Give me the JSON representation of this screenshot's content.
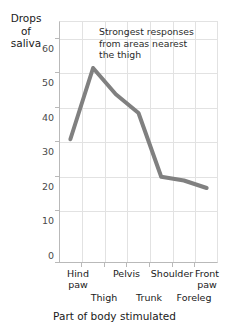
{
  "chart_data": {
    "type": "line",
    "title": "",
    "xlabel": "Part of body stimulated",
    "ylabel": "Drops of saliva",
    "ylabel_lines": [
      "Drops",
      "of",
      "saliva"
    ],
    "categories": [
      "Hind paw",
      "Thigh",
      "Pelvis",
      "Trunk",
      "Shoulder",
      "Foreleg",
      "Front paw"
    ],
    "values": [
      33,
      52,
      45,
      40,
      23,
      22,
      20
    ],
    "ylim": [
      0,
      65
    ],
    "yticks": [
      0,
      10,
      20,
      30,
      40,
      50,
      60
    ],
    "ytick_labels": [
      "0",
      "10",
      "20",
      "30",
      "40",
      "50",
      "60"
    ],
    "grid": true,
    "legend": "none",
    "series": [
      {
        "name": "Drops of saliva",
        "color": "#808080",
        "values": [
          33,
          52,
          45,
          40,
          23,
          22,
          20
        ]
      }
    ],
    "annotations": [
      {
        "text": "Strongest responses from areas nearest the thigh",
        "lines": [
          "Strongest responses",
          "from areas nearest",
          "the thigh"
        ]
      }
    ]
  },
  "axis": {
    "y_title_line1": "Drops",
    "y_title_line2": "of",
    "y_title_line3": "saliva",
    "x_title": "Part of body stimulated",
    "yticks": [
      "60",
      "50",
      "40",
      "30",
      "20",
      "10",
      "0"
    ],
    "xlabels_upper": [
      "Hind\npaw",
      "Pelvis",
      "Shoulder",
      "Front\npaw"
    ],
    "xlabels_lower": [
      "Thigh",
      "Trunk",
      "Foreleg"
    ],
    "xlabel_1_line1": "Hind",
    "xlabel_1_line2": "paw",
    "xlabel_2": "Thigh",
    "xlabel_3": "Pelvis",
    "xlabel_4": "Trunk",
    "xlabel_5": "Shoulder",
    "xlabel_6": "Foreleg",
    "xlabel_7_line1": "Front",
    "xlabel_7_line2": "paw"
  },
  "annotation": {
    "line1": "Strongest responses",
    "line2": "from areas nearest",
    "line3": "the thigh"
  },
  "colors": {
    "line": "#808080",
    "grid": "#e2e2e2",
    "axis": "#b9b9b9",
    "text": "#1a1a1a",
    "tick_text": "#4a4a4a",
    "background": "#ffffff"
  }
}
